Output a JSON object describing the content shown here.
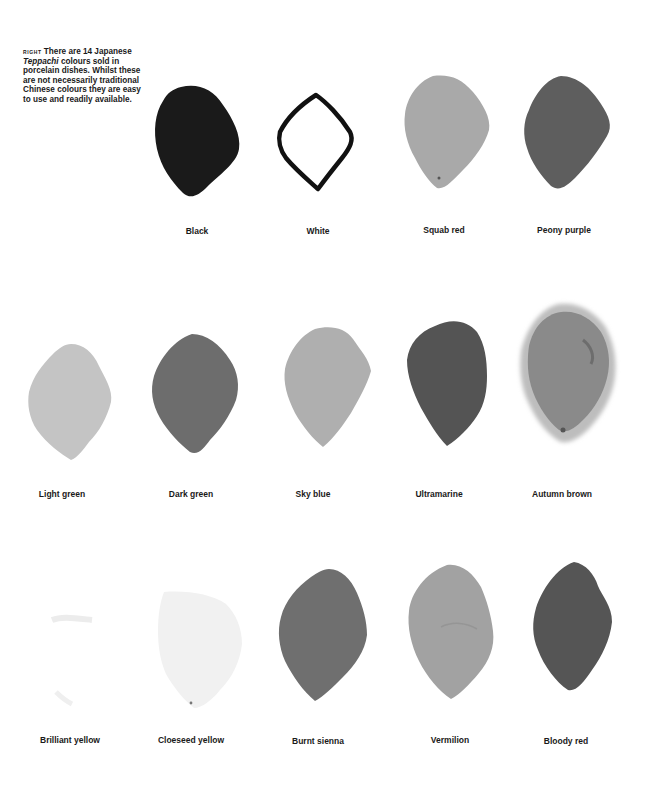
{
  "caption": {
    "tag": "RIGHT",
    "text_before": "There are 14 Japanese ",
    "emphasis": "Teppachi",
    "text_after": " colours sold in porcelain dishes. Whilst these are not necessarily traditional Chinese colours they are easy to use and readily available."
  },
  "swatches": [
    {
      "label": "Black",
      "fill": "#1a1a1a",
      "style": "filled"
    },
    {
      "label": "White",
      "fill": "#ffffff",
      "style": "outline"
    },
    {
      "label": "Squab red",
      "fill": "#a9a9a9",
      "style": "filled"
    },
    {
      "label": "Peony purple",
      "fill": "#5e5e5e",
      "style": "filled"
    },
    {
      "label": "Light green",
      "fill": "#c4c4c4",
      "style": "filled"
    },
    {
      "label": "Dark green",
      "fill": "#6d6d6d",
      "style": "filled"
    },
    {
      "label": "Sky blue",
      "fill": "#afafaf",
      "style": "filled"
    },
    {
      "label": "Ultramarine",
      "fill": "#545454",
      "style": "filled"
    },
    {
      "label": "Autumn brown",
      "fill": "#8a8a8a",
      "style": "textured"
    },
    {
      "label": "Brilliant yellow",
      "fill": "#f7f7f7",
      "style": "faint"
    },
    {
      "label": "Cloeseed yellow",
      "fill": "#f1f1f1",
      "style": "filled"
    },
    {
      "label": "Burnt sienna",
      "fill": "#6f6f6f",
      "style": "filled"
    },
    {
      "label": "Vermilion",
      "fill": "#a2a2a2",
      "style": "filled"
    },
    {
      "label": "Bloody red",
      "fill": "#555555",
      "style": "filled"
    }
  ]
}
